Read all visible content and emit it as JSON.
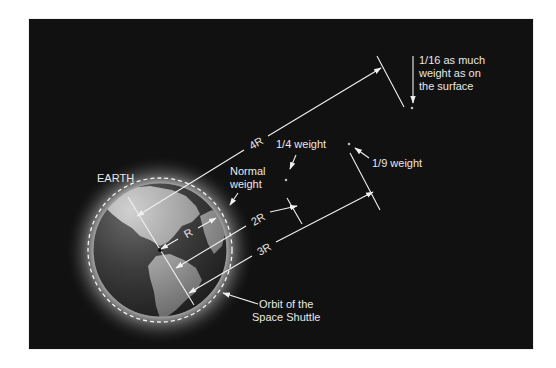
{
  "figure": {
    "title_label": "EARTH",
    "labels": {
      "normal_weight": [
        "Normal",
        "weight"
      ],
      "quarter_weight": "1/4 weight",
      "ninth_weight": "1/9 weight",
      "sixteenth_weight": [
        "1/16 as much",
        "weight as on",
        "the surface"
      ],
      "orbit": [
        "Orbit of the",
        "Space Shuttle"
      ]
    },
    "dimensions": {
      "r": "R",
      "two_r": "2R",
      "three_r": "3R",
      "four_r": "4R"
    },
    "colors": {
      "background": "#111111",
      "page": "#ffffff",
      "line": "#f0f0f0",
      "text": "#e8e8e8",
      "earth_ocean": "#3a3a3a",
      "earth_land": "#9a9a9a",
      "glow": "#cfcfcf"
    }
  }
}
